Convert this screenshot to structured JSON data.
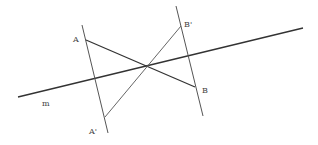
{
  "diagram": {
    "title": "",
    "colors": {
      "line": "#333333",
      "thin": "#555555",
      "label": "#444444"
    },
    "labels": {
      "A": "A",
      "A_prime": "A'",
      "B": "B",
      "B_prime": "B'",
      "m": "m"
    },
    "points": {
      "A": [
        86,
        40
      ],
      "A_prime": [
        105,
        117
      ],
      "B": [
        195,
        87
      ],
      "B_prime": [
        181,
        26
      ],
      "O": [
        147,
        66
      ]
    },
    "lines": {
      "m": [
        [
          18,
          97
        ],
        [
          303,
          28
        ]
      ],
      "perp_A": [
        [
          82,
          25
        ],
        [
          108,
          133
        ]
      ],
      "perp_B": [
        [
          176,
          6
        ],
        [
          203,
          116
        ]
      ],
      "seg_AB": [
        [
          86,
          40
        ],
        [
          195,
          87
        ]
      ],
      "seg_ApBp": [
        [
          105,
          117
        ],
        [
          181,
          26
        ]
      ]
    }
  }
}
